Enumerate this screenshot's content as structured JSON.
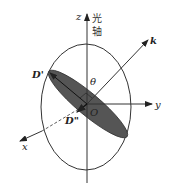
{
  "figure": {
    "type": "index-ellipsoid-diagram",
    "labels": {
      "z_axis": "z",
      "optic_axis_line1": "光",
      "optic_axis_line2": "轴",
      "k_vector": "k",
      "y_axis": "y",
      "x_axis": "x",
      "origin": "O",
      "angle": "θ",
      "d_prime": "D'",
      "d_double_prime": "D\""
    },
    "colors": {
      "line": "#333333",
      "shaded_section": "#555555",
      "background": "#ffffff"
    }
  }
}
